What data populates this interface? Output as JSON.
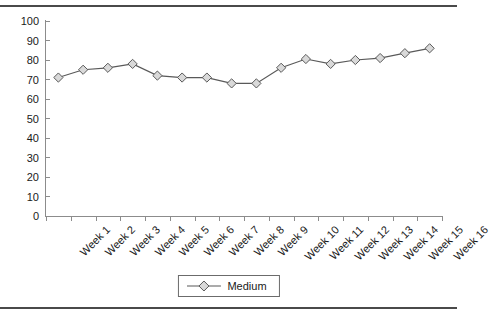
{
  "chart_data": {
    "type": "line",
    "title": "",
    "xlabel": "",
    "ylabel": "",
    "categories": [
      "Week 1",
      "Week 2",
      "Week 3",
      "Week 4",
      "Week 5",
      "Week 6",
      "Week 7",
      "Week 8",
      "Week 9",
      "Week 10",
      "Week 11",
      "Week 12",
      "Week 13",
      "Week 14",
      "Week 15",
      "Week 16"
    ],
    "series": [
      {
        "name": "Medium",
        "marker": "diamond",
        "values": [
          71,
          75,
          76,
          78,
          72,
          71,
          71,
          68,
          68,
          76,
          80.5,
          78,
          80,
          81,
          83.5,
          86
        ]
      }
    ],
    "ylim": [
      0,
      100
    ],
    "ytick_step": 10,
    "yticks": [
      "100",
      "90",
      "80",
      "70",
      "60",
      "50",
      "40",
      "30",
      "20",
      "10",
      "0"
    ],
    "grid": false,
    "legend_position": "bottom-center"
  },
  "legend": {
    "entries": [
      {
        "label": "Medium"
      }
    ]
  },
  "style": {
    "line_color": "#595959",
    "marker_fill": "#d9d9d9",
    "marker_stroke": "#595959",
    "axis_color": "#8c8c8c",
    "text_color": "#1a1a1a",
    "rule_color": "#4a4a4a",
    "background": "#ffffff"
  }
}
